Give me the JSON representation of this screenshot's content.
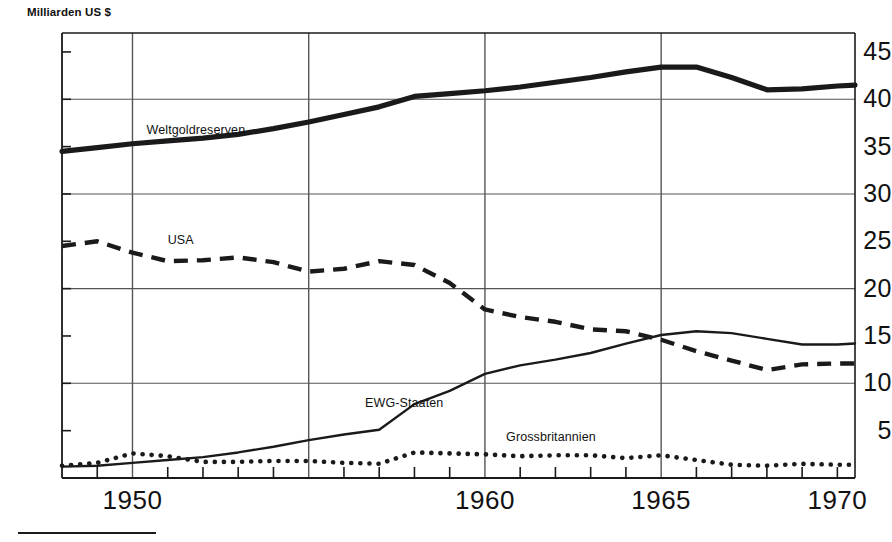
{
  "chart_data": {
    "type": "line",
    "title": "Milliarden US $",
    "xlabel": "",
    "ylabel": "Milliarden US $",
    "xlim": [
      1948,
      1970.5
    ],
    "ylim": [
      0,
      47
    ],
    "yticks": [
      5,
      10,
      15,
      20,
      25,
      30,
      35,
      40,
      45
    ],
    "ytick_labels": [
      "5",
      "10",
      "15",
      "20",
      "25",
      "30",
      "35",
      "40",
      "45"
    ],
    "gridlines_y": [
      10,
      20,
      30,
      40
    ],
    "xticks": [
      1949,
      1950,
      1951,
      1952,
      1953,
      1954,
      1955,
      1956,
      1957,
      1958,
      1959,
      1960,
      1961,
      1962,
      1963,
      1964,
      1965,
      1966,
      1967,
      1968,
      1969,
      1970
    ],
    "xtick_labels": [
      "1950",
      "1960",
      "1965",
      "1970"
    ],
    "xtick_label_values": [
      1950,
      1960,
      1965,
      1970
    ],
    "gridlines_x": [
      1950,
      1955,
      1960,
      1965
    ],
    "grid": true,
    "legend_position": "inline-annotations",
    "series": [
      {
        "name": "Weltgoldreserven",
        "style": "solid-thick",
        "label_x": 1950.4,
        "label_y": 36.6,
        "x": [
          1948,
          1949,
          1950,
          1951,
          1952,
          1953,
          1954,
          1955,
          1956,
          1957,
          1958,
          1959,
          1960,
          1961,
          1962,
          1963,
          1964,
          1965,
          1966,
          1967,
          1968,
          1969,
          1970,
          1970.5
        ],
        "values": [
          34.5,
          34.9,
          35.3,
          35.6,
          35.9,
          36.3,
          36.9,
          37.6,
          38.4,
          39.2,
          40.3,
          40.6,
          40.9,
          41.3,
          41.8,
          42.3,
          42.9,
          43.4,
          43.4,
          42.3,
          41.0,
          41.1,
          41.4,
          41.5
        ]
      },
      {
        "name": "USA",
        "style": "dashed",
        "label_x": 1951.0,
        "label_y": 25.0,
        "x": [
          1948,
          1949,
          1950,
          1951,
          1952,
          1953,
          1954,
          1955,
          1956,
          1957,
          1958,
          1959,
          1960,
          1961,
          1962,
          1963,
          1964,
          1965,
          1966,
          1967,
          1968,
          1969,
          1970,
          1970.5
        ],
        "values": [
          24.5,
          25.0,
          23.8,
          22.9,
          23.0,
          23.3,
          22.8,
          21.8,
          22.1,
          22.9,
          22.5,
          20.6,
          17.8,
          17.0,
          16.5,
          15.7,
          15.5,
          14.6,
          13.4,
          12.4,
          11.4,
          12.0,
          12.1,
          12.1
        ]
      },
      {
        "name": "EWG-Staaten",
        "style": "solid-thin",
        "label_x": 1956.6,
        "label_y": 7.8,
        "x": [
          1948,
          1949,
          1950,
          1951,
          1952,
          1953,
          1954,
          1955,
          1956,
          1957,
          1958,
          1959,
          1960,
          1961,
          1962,
          1963,
          1964,
          1965,
          1966,
          1967,
          1968,
          1969,
          1970,
          1970.5
        ],
        "values": [
          1.2,
          1.3,
          1.6,
          1.9,
          2.2,
          2.7,
          3.3,
          4.0,
          4.6,
          5.1,
          7.8,
          9.2,
          11.0,
          11.9,
          12.5,
          13.2,
          14.2,
          15.1,
          15.5,
          15.3,
          14.7,
          14.1,
          14.1,
          14.2
        ]
      },
      {
        "name": "Grossbritannien",
        "style": "dotted",
        "label_x": 1960.6,
        "label_y": 4.2,
        "x": [
          1948,
          1949,
          1950,
          1951,
          1952,
          1953,
          1954,
          1955,
          1956,
          1957,
          1958,
          1959,
          1960,
          1961,
          1962,
          1963,
          1964,
          1965,
          1966,
          1967,
          1968,
          1969,
          1970,
          1970.5
        ],
        "values": [
          1.3,
          1.6,
          2.6,
          2.3,
          1.7,
          1.7,
          1.8,
          1.8,
          1.6,
          1.5,
          2.7,
          2.6,
          2.5,
          2.3,
          2.4,
          2.4,
          2.1,
          2.4,
          1.9,
          1.4,
          1.3,
          1.5,
          1.4,
          1.4
        ]
      }
    ]
  },
  "axis": {
    "y_title": "Milliarden US $"
  },
  "colors": {
    "ink": "#1a1a1a",
    "grid": "#555555",
    "background": "#ffffff"
  }
}
